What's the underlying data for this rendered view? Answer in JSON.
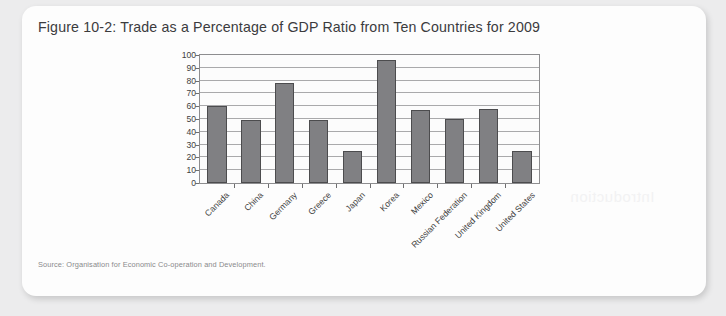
{
  "figure": {
    "title": "Figure 10-2: Trade as a Percentage of GDP Ratio from Ten Countries for 2009",
    "source": "Source: Organisation for Economic Co-operation and Development.",
    "page_bleed_artifact": "Introduction"
  },
  "chart_data": {
    "type": "bar",
    "title": "Figure 10-2: Trade as a Percentage of GDP Ratio from Ten Countries for 2009",
    "xlabel": "",
    "ylabel": "",
    "ylim": [
      0,
      100
    ],
    "ytick_step": 10,
    "yticks": [
      0,
      10,
      20,
      30,
      40,
      50,
      60,
      70,
      80,
      90,
      100
    ],
    "grid": true,
    "legend": false,
    "bar_color": "#808083",
    "bar_border_color": "#4c4c4e",
    "categories": [
      "Canada",
      "China",
      "Germany",
      "Greece",
      "Japan",
      "Korea",
      "Mexico",
      "Russian Federation",
      "United Kingdom",
      "United States"
    ],
    "values": [
      60,
      49,
      78,
      49,
      25,
      96,
      57,
      50,
      58,
      25
    ]
  }
}
